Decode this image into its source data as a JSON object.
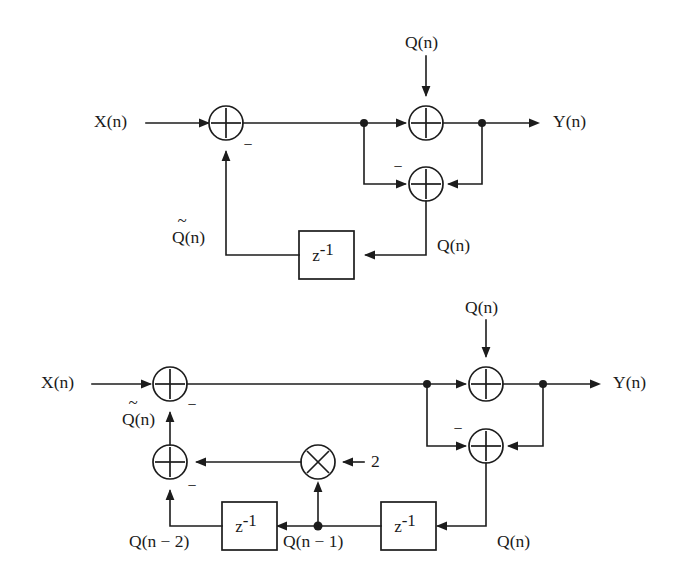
{
  "figure": {
    "line_color": "#1c1c1c",
    "background": "#ffffff",
    "text_color": "#1a1a1a"
  },
  "glyphs": {
    "minus": "−",
    "tilde": "~",
    "z_base": "z",
    "z_exponent": "-1"
  },
  "diagrams": [
    {
      "id": "first-order",
      "name": "first-order-error-feedback",
      "labels": {
        "input": "X(n)",
        "output": "Y(n)",
        "noise_source": "Q(n)",
        "quantization_error": "Q(n)",
        "feedback_estimate": "Q̃(n)",
        "feedback_estimate_base": "Q(n)",
        "delay": "z",
        "delay_exponent": "-1",
        "minus_input": "−",
        "minus_feedback": "−"
      }
    },
    {
      "id": "second-order",
      "name": "second-order-error-feedback",
      "labels": {
        "input": "X(n)",
        "output": "Y(n)",
        "noise_source": "Q(n)",
        "quantization_error": "Q(n)",
        "feedback_estimate": "Q̃(n)",
        "feedback_estimate_base": "Q(n)",
        "delay_one": "z",
        "delay_one_exponent": "-1",
        "delay_two": "z",
        "delay_two_exponent": "-1",
        "tap_one": "Q(n − 1)",
        "tap_two": "Q(n − 2)",
        "gain": "2",
        "minus_input": "−",
        "minus_feedback": "−",
        "minus_adder_top": "−",
        "minus_adder_bottom": "−"
      }
    }
  ]
}
